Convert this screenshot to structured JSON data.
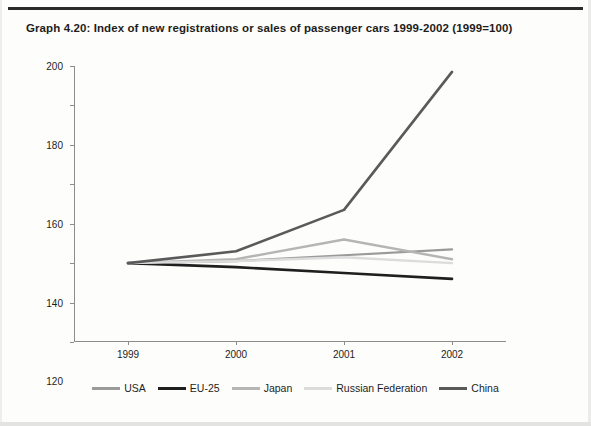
{
  "page": {
    "title": "Graph 4.20: Index of new registrations or sales of passenger cars 1999-2002 (1999=100)"
  },
  "chart_data": {
    "type": "line",
    "title": "Graph 4.20: Index of new registrations or sales of passenger cars 1999-2002 (1999=100)",
    "xlabel": "",
    "ylabel": "",
    "categories": [
      "1999",
      "2000",
      "2001",
      "2002"
    ],
    "x_tick_labels": [
      "1999",
      "2000",
      "2001",
      "2002"
    ],
    "y_tick_labels": [
      "60",
      "80",
      "100",
      "120",
      "140",
      "160",
      "180",
      "200"
    ],
    "y_ticks": [
      60,
      80,
      100,
      120,
      140,
      160,
      180,
      200
    ],
    "ylim": [
      60,
      200
    ],
    "grid": false,
    "legend_position": "bottom",
    "series": [
      {
        "name": "USA",
        "color": "#9a9a9a",
        "width": 2.2,
        "values": [
          100,
          101,
          104,
          107
        ]
      },
      {
        "name": "EU-25",
        "color": "#1f1f1f",
        "width": 2.6,
        "values": [
          100,
          98,
          95,
          92
        ]
      },
      {
        "name": "Japan",
        "color": "#b5b5b5",
        "width": 2.4,
        "values": [
          100,
          102,
          112,
          102
        ]
      },
      {
        "name": "Russian Federation",
        "color": "#dcdcdc",
        "width": 2.4,
        "values": [
          100,
          101,
          103,
          100
        ]
      },
      {
        "name": "China",
        "color": "#5a5a5a",
        "width": 2.6,
        "values": [
          100,
          106,
          127,
          197
        ]
      }
    ]
  },
  "legend": {
    "items": [
      {
        "label": "USA",
        "color": "#9a9a9a"
      },
      {
        "label": "EU-25",
        "color": "#1f1f1f"
      },
      {
        "label": "Japan",
        "color": "#b5b5b5"
      },
      {
        "label": "Russian Federation",
        "color": "#dcdcdc"
      },
      {
        "label": "China",
        "color": "#5a5a5a"
      }
    ]
  }
}
